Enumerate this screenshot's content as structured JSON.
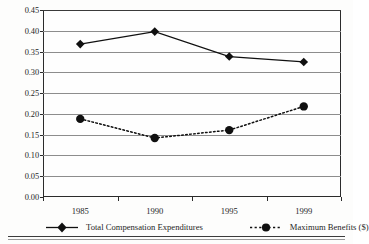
{
  "chart_data": {
    "type": "line",
    "title": "",
    "xlabel": "",
    "ylabel": "Standard Deviation/Mean",
    "categories": [
      "1985",
      "1990",
      "1995",
      "1999"
    ],
    "ylim": [
      0.0,
      0.45
    ],
    "ytick_values": [
      0.0,
      0.05,
      0.1,
      0.15,
      0.2,
      0.25,
      0.3,
      0.35,
      0.4,
      0.45
    ],
    "ytick_labels": [
      "0.00",
      "0.05",
      "0.10",
      "0.15",
      "0.20",
      "0.25",
      "0.30",
      "0.35",
      "0.40",
      "0.45"
    ],
    "grid": "horizontal",
    "legend_position": "bottom",
    "series": [
      {
        "name": "Total Compensation Expenditures",
        "values": [
          0.368,
          0.398,
          0.338,
          0.325
        ],
        "marker": "diamond",
        "linestyle": "solid",
        "color": "#101010"
      },
      {
        "name": "Maximum Benefits ($)",
        "values": [
          0.188,
          0.142,
          0.161,
          0.218
        ],
        "marker": "circle",
        "linestyle": "dotted",
        "color": "#101010"
      }
    ]
  },
  "legend": {
    "entries": [
      {
        "label": "Total Compensation Expenditures"
      },
      {
        "label": "Maximum Benefits ($)"
      }
    ]
  },
  "colors": {
    "axis": "#2b2b2b",
    "gridline": "#8d8d8d",
    "series": "#101010",
    "background": "#fdfdfc"
  }
}
